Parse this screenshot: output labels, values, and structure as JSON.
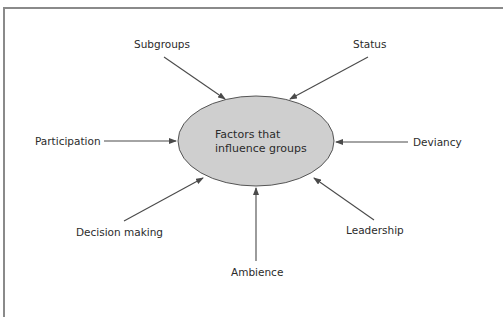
{
  "diagram": {
    "type": "hub-and-spoke",
    "center": {
      "line1": "Factors that",
      "line2": "influence groups",
      "fill": "#cfcfcf",
      "stroke": "#555555"
    },
    "colors": {
      "arrow": "#4a4a4a",
      "text": "#2b2b2b",
      "frame": "#8a8a8a",
      "background": "#ffffff"
    },
    "factors": [
      {
        "id": "subgroups",
        "label": "Subgroups",
        "direction": "top-left"
      },
      {
        "id": "status",
        "label": "Status",
        "direction": "top-right"
      },
      {
        "id": "participation",
        "label": "Participation",
        "direction": "left"
      },
      {
        "id": "deviancy",
        "label": "Deviancy",
        "direction": "right"
      },
      {
        "id": "decision-making",
        "label": "Decision making",
        "direction": "bottom-left"
      },
      {
        "id": "ambience",
        "label": "Ambience",
        "direction": "bottom"
      },
      {
        "id": "leadership",
        "label": "Leadership",
        "direction": "bottom-right"
      }
    ],
    "arrows_point_to": "center"
  }
}
